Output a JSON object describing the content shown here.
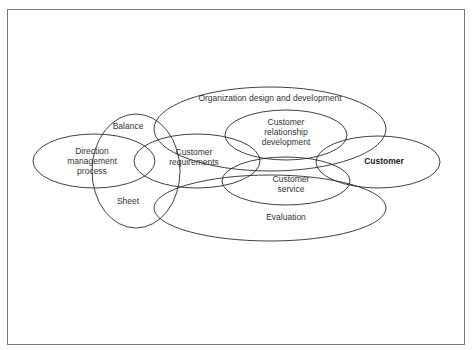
{
  "diagram": {
    "nodes": [
      {
        "id": "organization",
        "label": "Organization design and development",
        "lines": [
          "Organization design and development"
        ],
        "cx": 270,
        "cy": 129,
        "rx": 116,
        "ry": 42,
        "label_x": 270,
        "label_y": 98,
        "bold": false
      },
      {
        "id": "balance-sheet",
        "label": "Balance / Sheet",
        "lines": [],
        "cx": 136,
        "cy": 171,
        "rx": 44,
        "ry": 57,
        "label_x": 0,
        "label_y": 0,
        "bold": false
      },
      {
        "id": "balance",
        "label": "Balance",
        "lines": [
          "Balance"
        ],
        "label_x": 128,
        "label_y": 126,
        "bold": false
      },
      {
        "id": "sheet",
        "label": "Sheet",
        "lines": [
          "Sheet"
        ],
        "label_x": 128,
        "label_y": 201,
        "bold": false
      },
      {
        "id": "evaluation",
        "label": "Evaluation",
        "lines": [
          "Evaluation"
        ],
        "cx": 270,
        "cy": 208,
        "rx": 116,
        "ry": 33,
        "label_x": 286,
        "label_y": 217,
        "bold": false
      },
      {
        "id": "direction",
        "label": "Direction management process",
        "lines": [
          "Direction",
          "management",
          "process"
        ],
        "cx": 94,
        "cy": 161,
        "rx": 61,
        "ry": 27,
        "label_x": 92,
        "label_y": 161,
        "bold": false
      },
      {
        "id": "customer-requirements",
        "label": "Customer requirements",
        "lines": [
          "Customer",
          "requirements"
        ],
        "cx": 197,
        "cy": 161,
        "rx": 63,
        "ry": 27,
        "label_x": 194,
        "label_y": 157,
        "bold": false
      },
      {
        "id": "customer-relationship",
        "label": "Customer relationship development",
        "lines": [
          "Customer",
          "relationship",
          "development"
        ],
        "cx": 286,
        "cy": 135,
        "rx": 61,
        "ry": 25,
        "label_x": 286,
        "label_y": 132,
        "bold": false
      },
      {
        "id": "customer-service",
        "label": "Customer service",
        "lines": [
          "Customer",
          "service"
        ],
        "cx": 286,
        "cy": 181,
        "rx": 64,
        "ry": 24,
        "label_x": 291,
        "label_y": 184,
        "bold": false
      },
      {
        "id": "customer",
        "label": "Customer",
        "lines": [
          "Customer"
        ],
        "cx": 378,
        "cy": 162,
        "rx": 62,
        "ry": 26,
        "label_x": 384,
        "label_y": 161,
        "bold": true
      }
    ]
  },
  "labels": {
    "organization": "Organization design and development",
    "balance": "Balance",
    "sheet": "Sheet",
    "evaluation": "Evaluation",
    "direction_1": "Direction",
    "direction_2": "management",
    "direction_3": "process",
    "requirements_1": "Customer",
    "requirements_2": "requirements",
    "relationship_1": "Customer",
    "relationship_2": "relationship",
    "relationship_3": "development",
    "service_1": "Customer",
    "service_2": "service",
    "customer": "Customer"
  },
  "colors": {
    "stroke": "#2a2a2a",
    "frame": "#7a7a7a",
    "text": "#333333",
    "background": "#ffffff"
  }
}
